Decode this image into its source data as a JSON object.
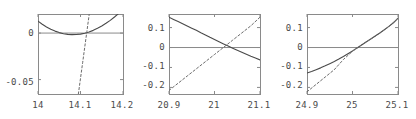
{
  "figure": {
    "width": 416,
    "height": 119,
    "background": "#ffffff",
    "frame_color": "#8a8a8a",
    "axis_color": "#8a8a8a",
    "solid_curve_color": "#4a4a4a",
    "dashed_curve_color": "#6b6b6b",
    "tick_label_color": "#4a4a4a",
    "panel_count": 3
  },
  "chart_data": [
    {
      "type": "line",
      "title": "",
      "xlabel": "",
      "ylabel": "",
      "xlim": [
        14.0,
        14.2
      ],
      "ylim": [
        -0.0655,
        0.0205
      ],
      "xticks": [
        14.0,
        14.1,
        14.2
      ],
      "xtick_labels": [
        "14",
        "14.1",
        "14.2"
      ],
      "yticks": [
        0,
        -0.05
      ],
      "ytick_labels": [
        "0",
        "-0.05"
      ],
      "grid": false,
      "legend": "none",
      "zero_line": true,
      "series": [
        {
          "name": "solid-parabola",
          "style": "solid",
          "x": [
            14.0,
            14.01,
            14.02,
            14.03,
            14.04,
            14.05,
            14.06,
            14.07,
            14.08,
            14.09,
            14.1,
            14.11,
            14.12,
            14.13,
            14.14,
            14.15,
            14.16,
            14.17,
            14.18,
            14.19,
            14.2
          ],
          "y": [
            0.0128,
            0.0095,
            0.0066,
            0.0041,
            0.0021,
            0.0005,
            -0.0007,
            -0.0014,
            -0.0017,
            -0.0016,
            -0.0011,
            -0.0002,
            0.0012,
            0.0029,
            0.0051,
            0.0076,
            0.0105,
            0.0137,
            0.0173,
            0.0212,
            0.0253
          ]
        },
        {
          "name": "dashed-line",
          "style": "dashed",
          "x": [
            14.095,
            14.1,
            14.105,
            14.11,
            14.115,
            14.12,
            14.125
          ],
          "y": [
            -0.0655,
            -0.0487,
            -0.0319,
            -0.0151,
            0.0017,
            0.0185,
            0.0353
          ]
        }
      ]
    },
    {
      "type": "line",
      "title": "",
      "xlabel": "",
      "ylabel": "",
      "xlim": [
        20.9,
        21.1
      ],
      "ylim": [
        -0.233,
        0.168
      ],
      "xticks": [
        20.9,
        21.0,
        21.1
      ],
      "xtick_labels": [
        "20.9",
        "21",
        "21.1"
      ],
      "yticks": [
        0.1,
        0,
        -0.1,
        -0.2
      ],
      "ytick_labels": [
        "0.1",
        "0",
        "-0.1",
        "-0.2"
      ],
      "grid": false,
      "legend": "none",
      "zero_line": true,
      "series": [
        {
          "name": "solid-decreasing-curve",
          "style": "solid",
          "x": [
            20.9,
            20.91,
            20.92,
            20.93,
            20.94,
            20.95,
            20.96,
            20.97,
            20.98,
            20.99,
            21.0,
            21.01,
            21.02,
            21.03,
            21.04,
            21.05,
            21.06,
            21.07,
            21.08,
            21.09,
            21.1
          ],
          "y": [
            0.152,
            0.141,
            0.13,
            0.119,
            0.108,
            0.097,
            0.086,
            0.074,
            0.063,
            0.051,
            0.04,
            0.029,
            0.018,
            0.007,
            -0.004,
            -0.014,
            -0.024,
            -0.034,
            -0.044,
            -0.053,
            -0.062
          ]
        },
        {
          "name": "dashed-increasing-line",
          "style": "dashed",
          "x": [
            20.9,
            20.92,
            20.94,
            20.96,
            20.98,
            21.0,
            21.02,
            21.04,
            21.06,
            21.08,
            21.1
          ],
          "y": [
            -0.215,
            -0.179,
            -0.143,
            -0.107,
            -0.071,
            -0.035,
            0.001,
            0.037,
            0.073,
            0.109,
            0.152
          ]
        }
      ]
    },
    {
      "type": "line",
      "title": "",
      "xlabel": "",
      "ylabel": "",
      "xlim": [
        24.9,
        25.1
      ],
      "ylim": [
        -0.233,
        0.168
      ],
      "xticks": [
        24.9,
        25.0,
        25.1
      ],
      "xtick_labels": [
        "24.9",
        "25",
        "25.1"
      ],
      "yticks": [
        0.1,
        0,
        -0.1,
        -0.2
      ],
      "ytick_labels": [
        "0.1",
        "0",
        "-0.1",
        "-0.2"
      ],
      "grid": false,
      "legend": "none",
      "zero_line": true,
      "series": [
        {
          "name": "solid-increasing-curve",
          "style": "solid",
          "x": [
            24.9,
            24.91,
            24.92,
            24.93,
            24.94,
            24.95,
            24.96,
            24.97,
            24.98,
            24.99,
            25.0,
            25.01,
            25.02,
            25.03,
            25.04,
            25.05,
            25.06,
            25.07,
            25.08,
            25.09,
            25.1
          ],
          "y": [
            -0.128,
            -0.12,
            -0.111,
            -0.102,
            -0.092,
            -0.081,
            -0.07,
            -0.058,
            -0.045,
            -0.031,
            -0.017,
            -0.002,
            0.013,
            0.028,
            0.043,
            0.058,
            0.073,
            0.089,
            0.106,
            0.124,
            0.147
          ]
        },
        {
          "name": "dashed-tangent-line",
          "style": "dashed",
          "x": [
            24.9,
            24.92,
            24.94,
            24.96,
            24.98,
            25.0,
            25.02,
            25.04,
            25.06,
            25.08,
            25.1
          ],
          "y": [
            -0.222,
            -0.185,
            -0.148,
            -0.111,
            -0.06,
            -0.019,
            0.014,
            0.042,
            0.072,
            0.105,
            0.147
          ]
        }
      ]
    }
  ],
  "panels": [
    {
      "name": "plot-1",
      "frame": {
        "left": 38,
        "top": 14,
        "right": 123,
        "bottom": 94
      },
      "xtick_labels": [
        {
          "text": "14",
          "x": 38,
          "y": 101
        },
        {
          "text": "14.1",
          "x": 80,
          "y": 101
        },
        {
          "text": "14.2",
          "x": 122,
          "y": 101
        }
      ],
      "ytick_labels": [
        {
          "text": "0",
          "x": 34,
          "y": 33
        },
        {
          "text": "-0.05",
          "x": 34,
          "y": 82
        }
      ]
    },
    {
      "name": "plot-2",
      "frame": {
        "left": 169,
        "top": 14,
        "right": 260,
        "bottom": 94
      },
      "xtick_labels": [
        {
          "text": "20.9",
          "x": 169,
          "y": 101
        },
        {
          "text": "21",
          "x": 214,
          "y": 101
        },
        {
          "text": "21.1",
          "x": 259,
          "y": 101
        }
      ],
      "ytick_labels": [
        {
          "text": "0.1",
          "x": 165,
          "y": 28
        },
        {
          "text": "0",
          "x": 165,
          "y": 47
        },
        {
          "text": "-0.1",
          "x": 165,
          "y": 66
        },
        {
          "text": "-0.2",
          "x": 165,
          "y": 85
        }
      ]
    },
    {
      "name": "plot-3",
      "frame": {
        "left": 307,
        "top": 14,
        "right": 398,
        "bottom": 94
      },
      "xtick_labels": [
        {
          "text": "24.9",
          "x": 307,
          "y": 101
        },
        {
          "text": "25",
          "x": 352,
          "y": 101
        },
        {
          "text": "25.1",
          "x": 397,
          "y": 101
        }
      ],
      "ytick_labels": [
        {
          "text": "0.1",
          "x": 303,
          "y": 28
        },
        {
          "text": "0",
          "x": 303,
          "y": 47
        },
        {
          "text": "-0.1",
          "x": 303,
          "y": 66
        },
        {
          "text": "-0.2",
          "x": 303,
          "y": 85
        }
      ]
    }
  ]
}
